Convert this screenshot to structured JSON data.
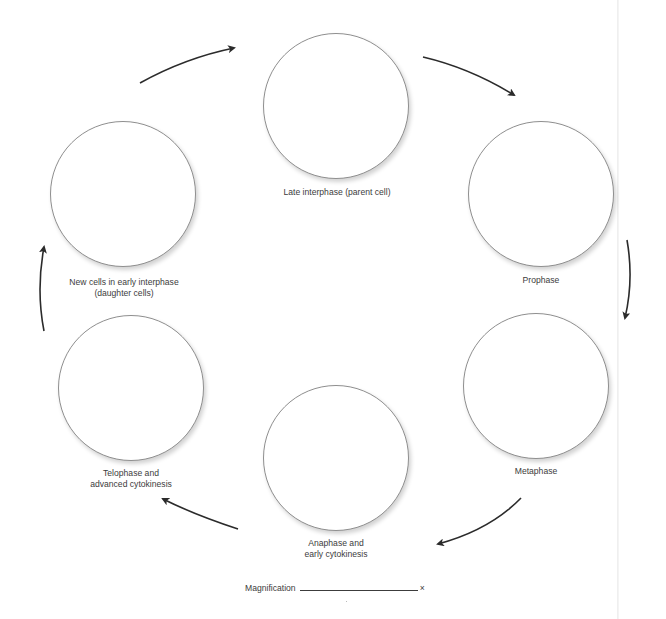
{
  "diagram": {
    "stages": [
      {
        "id": "late-interphase",
        "lines": [
          "Late interphase (parent cell)"
        ],
        "center": [
          336,
          106
        ],
        "radius": 73
      },
      {
        "id": "prophase",
        "lines": [
          "Prophase"
        ],
        "center": [
          541,
          194
        ],
        "radius": 73
      },
      {
        "id": "metaphase",
        "lines": [
          "Metaphase"
        ],
        "center": [
          536,
          386
        ],
        "radius": 73
      },
      {
        "id": "anaphase",
        "lines": [
          "Anaphase and",
          "early cytokinesis"
        ],
        "center": [
          336,
          458
        ],
        "radius": 73
      },
      {
        "id": "telophase",
        "lines": [
          "Telophase and",
          "advanced cytokinesis"
        ],
        "center": [
          131,
          388
        ],
        "radius": 73
      },
      {
        "id": "early-interphase",
        "lines": [
          "New cells in early interphase",
          "(daughter cells)"
        ],
        "center": [
          123,
          194
        ],
        "radius": 73
      }
    ],
    "arrows": [
      {
        "from": "early-interphase",
        "to": "late-interphase"
      },
      {
        "from": "late-interphase",
        "to": "prophase"
      },
      {
        "from": "prophase",
        "to": "metaphase"
      },
      {
        "from": "metaphase",
        "to": "anaphase"
      },
      {
        "from": "anaphase",
        "to": "telophase"
      },
      {
        "from": "telophase",
        "to": "early-interphase"
      }
    ],
    "magnification": {
      "label": "Magnification",
      "value": "",
      "unit": "×"
    },
    "colors": {
      "outline": "#8f8f8f",
      "arrow": "#2b2b2b",
      "text": "#3c3c3c"
    }
  }
}
